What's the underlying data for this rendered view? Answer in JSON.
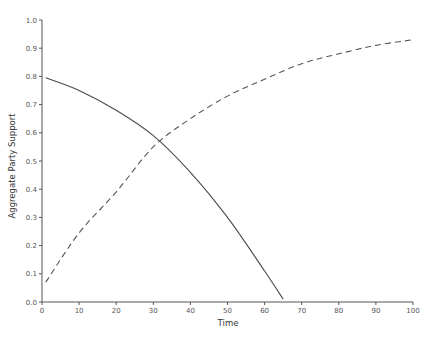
{
  "chart_data": {
    "type": "line",
    "title": "",
    "xlabel": "Time",
    "ylabel": "Aggregate Party Support",
    "xlim": [
      0,
      100
    ],
    "ylim": [
      0.0,
      1.0
    ],
    "grid": false,
    "legend": null,
    "x_ticks": [
      "0",
      "10",
      "20",
      "30",
      "40",
      "50",
      "60",
      "70",
      "80",
      "90",
      "100"
    ],
    "y_ticks": [
      "0.0",
      "0.1",
      "0.2",
      "0.3",
      "0.4",
      "0.5",
      "0.6",
      "0.7",
      "0.8",
      "0.9",
      "1.0"
    ],
    "series": [
      {
        "name": "solid (declining support)",
        "style": "solid",
        "x": [
          1,
          10,
          20,
          30,
          40,
          50,
          60,
          65
        ],
        "values": [
          0.795,
          0.75,
          0.68,
          0.59,
          0.46,
          0.3,
          0.11,
          0.01
        ]
      },
      {
        "name": "dashed (rising support)",
        "style": "dashed",
        "x": [
          1,
          10,
          20,
          30,
          40,
          50,
          60,
          70,
          80,
          90,
          100
        ],
        "values": [
          0.07,
          0.245,
          0.39,
          0.55,
          0.65,
          0.73,
          0.79,
          0.845,
          0.88,
          0.91,
          0.93
        ]
      }
    ],
    "annotations": [
      {
        "type": "intersection",
        "x": 31.5,
        "y": 0.567
      }
    ]
  }
}
